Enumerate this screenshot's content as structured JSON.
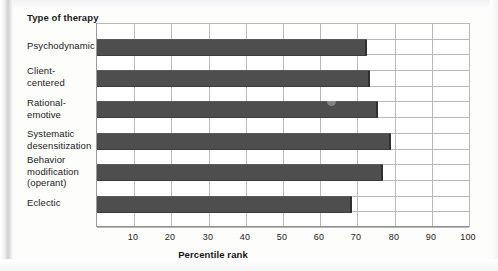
{
  "chart_data": {
    "type": "bar",
    "orientation": "horizontal",
    "title": "",
    "xlabel": "Percentile rank",
    "ylabel": "Type of therapy",
    "categories": [
      "Psychodynamic",
      "Client-\ncentered",
      "Rational-\nemotive",
      "Systematic\ndesensitization",
      "Behavior\nmodification\n(operant)",
      "Eclectic"
    ],
    "values": [
      72.5,
      73.5,
      75.5,
      79,
      77,
      68.5
    ],
    "xlim": [
      0,
      100
    ],
    "xticks": [
      10,
      20,
      30,
      40,
      50,
      60,
      70,
      80,
      90,
      100
    ],
    "xtick_labels": [
      "10",
      "20",
      "30",
      "40",
      "50",
      "60",
      "70",
      "80",
      "90",
      "100"
    ],
    "grid": true,
    "legend": false,
    "bar_color": "#4e4e4e",
    "grid_color": "#b9b9b9",
    "background": "#ffffff"
  },
  "axis": {
    "y_title": "Type of\ntherapy",
    "x_title": "Percentile rank"
  }
}
